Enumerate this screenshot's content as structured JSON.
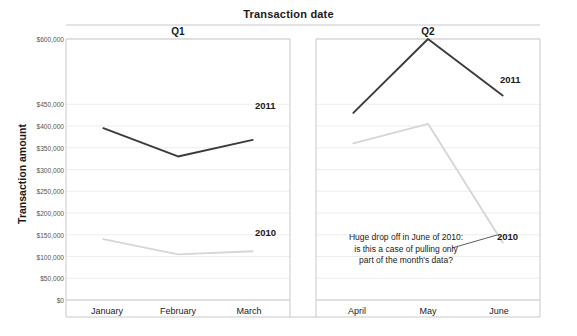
{
  "chart_data": {
    "type": "line",
    "title": "Transaction date",
    "xlabel": "",
    "ylabel": "Transaction amount",
    "ylim": [
      0,
      600000
    ],
    "grid": true,
    "legend_position": "inline-right-of-series",
    "panels": [
      {
        "name": "Q1",
        "categories": [
          "January",
          "February",
          "March"
        ],
        "series": [
          {
            "name": "2011",
            "values": [
              395000,
              330000,
              368000
            ],
            "color": "#3b3b3b"
          },
          {
            "name": "2010",
            "values": [
              140000,
              105000,
              112000
            ],
            "color": "#d6d6d6"
          }
        ]
      },
      {
        "name": "Q2",
        "categories": [
          "April",
          "May",
          "June"
        ],
        "series": [
          {
            "name": "2011",
            "values": [
              430000,
              600000,
              470000
            ],
            "color": "#3b3b3b"
          },
          {
            "name": "2010",
            "values": [
              360000,
              405000,
              132000
            ],
            "color": "#d6d6d6"
          }
        ]
      }
    ],
    "y_tick_labels": [
      "$600,000",
      "$450,000",
      "$400,000",
      "$350,000",
      "$300,000",
      "$250,000",
      "$200,000",
      "$150,000",
      "$100,000",
      "$50,000",
      "$0"
    ],
    "y_tick_values": [
      600000,
      450000,
      400000,
      350000,
      300000,
      250000,
      200000,
      150000,
      100000,
      50000,
      0
    ],
    "annotations": [
      {
        "text": "Huge drop off in June of 2010:\nis this a case of pulling only\npart of the month's data?",
        "target_series": "2010",
        "target_panel": "Q2",
        "target_category": "June"
      }
    ],
    "colors": {
      "series_2011": "#3b3b3b",
      "series_2010": "#d6d6d6",
      "grid": "#ededed",
      "axis": "#c9c9c9",
      "text": "#1a1a1a"
    }
  },
  "labels": {
    "title": "Transaction date",
    "y_axis_title": "Transaction amount",
    "panel_q1": "Q1",
    "panel_q2": "Q2",
    "series_2011_q1": "2011",
    "series_2010_q1": "2010",
    "series_2011_q2": "2011",
    "series_2010_q2": "2010",
    "annotation_q2": "Huge drop off in June of 2010:\nis this a case of pulling only\npart of the month's data?",
    "x_jan": "January",
    "x_feb": "February",
    "x_mar": "March",
    "x_apr": "April",
    "x_may": "May",
    "x_jun": "June"
  }
}
